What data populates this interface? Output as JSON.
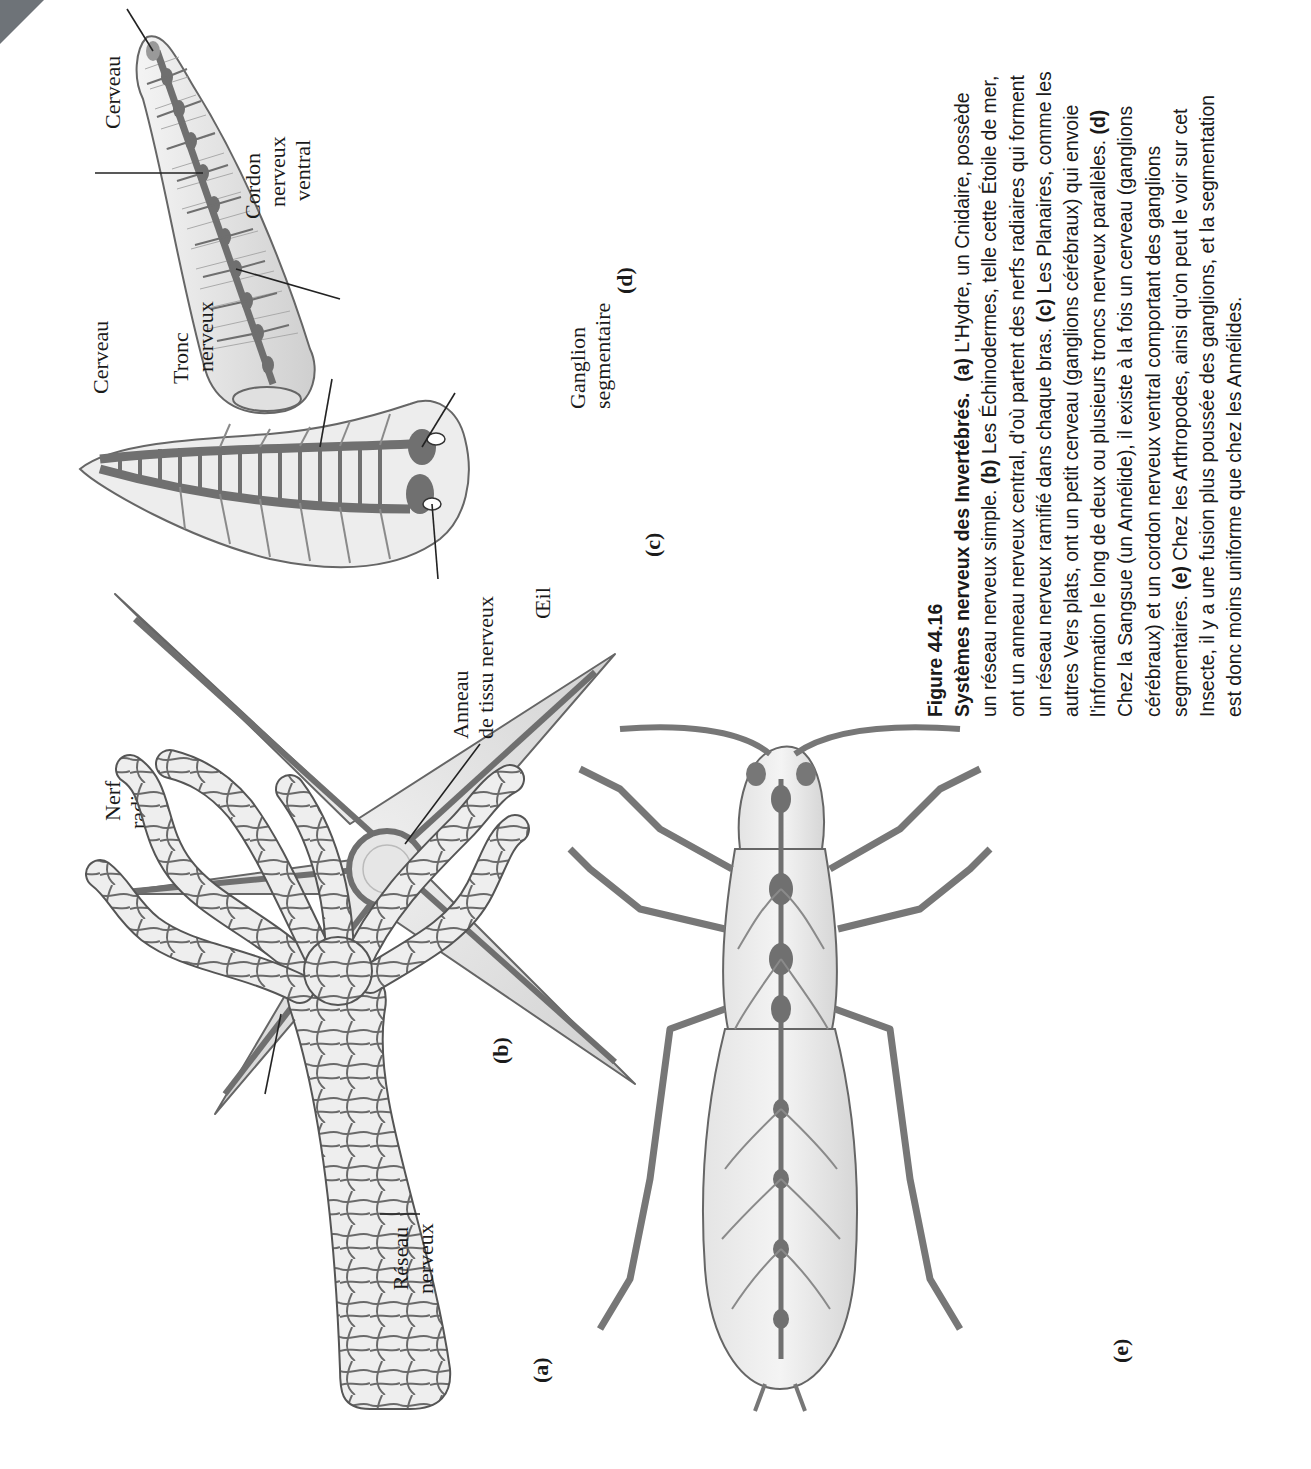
{
  "figure": {
    "number": "Figure 44.16",
    "title": "Systèmes nerveux des Invertébrés.",
    "caption_segments": [
      {
        "tag": "(a)",
        "text": " L'Hydre, un Cnidaire, possède un réseau nerveux simple. "
      },
      {
        "tag": "(b)",
        "text": " Les Échinodermes, telle cette Étoile de mer, ont un anneau nerveux central, d'où partent des nerfs radiaires qui forment un réseau nerveux ramifié dans chaque bras. "
      },
      {
        "tag": "(c)",
        "text": " Les Planaires, comme les autres Vers plats, ont un petit cerveau (ganglions cérébraux) qui envoie l'information le long de deux ou plusieurs troncs nerveux parallèles. "
      },
      {
        "tag": "(d)",
        "text": " Chez la Sangsue (un Annélide), il existe à la fois un cerveau (ganglions cérébraux) et un cordon nerveux ventral comportant des ganglions segmentaires. "
      },
      {
        "tag": "(e)",
        "text": " Chez les Arthropodes, ainsi qu'on peut le voir sur cet Insecte, il y a une fusion plus poussée des ganglions, et la segmentation est donc moins uniforme que chez les Annélides."
      }
    ]
  },
  "panels": {
    "a": {
      "tag": "(a)",
      "organism": "hydra",
      "labels": {
        "nerve_net_line1": "Réseau",
        "nerve_net_line2": "nerveux"
      }
    },
    "b": {
      "tag": "(b)",
      "organism": "sea-star",
      "labels": {
        "radial_nerve_line1": "Nerf",
        "radial_nerve_line2": "radiaire",
        "nerve_ring_line1": "Anneau",
        "nerve_ring_line2": "de tissu nerveux"
      }
    },
    "c": {
      "tag": "(c)",
      "organism": "planarian",
      "labels": {
        "brain": "Cerveau",
        "nerve_cord_line1": "Tronc",
        "nerve_cord_line2": "nerveux",
        "eye": "Œil"
      }
    },
    "d": {
      "tag": "(d)",
      "organism": "leech",
      "labels": {
        "brain": "Cerveau",
        "ventral_cord_line1": "Cordon",
        "ventral_cord_line2": "nerveux",
        "ventral_cord_line3": "ventral",
        "ganglion_line1": "Ganglion",
        "ganglion_line2": "segmentaire"
      }
    },
    "e": {
      "tag": "(e)",
      "organism": "insect"
    }
  },
  "colors": {
    "nerve": "#6f6f6f",
    "body_fill": "#ececec",
    "outline": "#555555",
    "text": "#1a1a1a"
  }
}
